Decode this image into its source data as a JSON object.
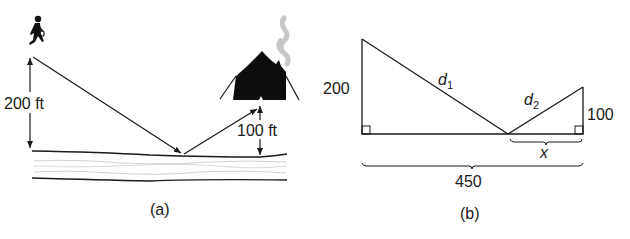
{
  "panel_a": {
    "caption": "(a)",
    "height_person_label": "200 ft",
    "height_tent_label": "100 ft",
    "icons": {
      "person": "person-with-bucket-icon",
      "tent": "burning-tent-icon",
      "smoke": "smoke-icon",
      "river": "river-icon"
    }
  },
  "panel_b": {
    "caption": "(b)",
    "left_height_label": "200",
    "right_height_label": "100",
    "hyp1_label": "d",
    "hyp1_sub": "1",
    "hyp2_label": "d",
    "hyp2_sub": "2",
    "x_label": "x",
    "base_label": "450"
  },
  "colors": {
    "ink": "#1a1a1a",
    "smoke": "#c8c8c8",
    "river_lines": "#d0d0d0"
  }
}
